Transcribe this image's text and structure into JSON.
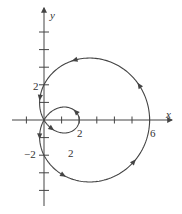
{
  "chart_data": {
    "type": "line",
    "title": "",
    "curve": "polar r = 2 + 4cos(theta), limacon with inner loop",
    "xlabel": "x",
    "ylabel": "y",
    "xlim": [
      -2,
      7
    ],
    "ylim": [
      -5,
      6
    ],
    "x_tick_labels": [
      {
        "value": 2,
        "label": "2"
      },
      {
        "value": 6,
        "label": "6"
      }
    ],
    "y_tick_labels": [
      {
        "value": 2,
        "label": "2"
      },
      {
        "value": -2,
        "label": "-2"
      }
    ],
    "x_ticks": [
      -1,
      1,
      2,
      3,
      4,
      5,
      6
    ],
    "y_ticks": [
      -4,
      -3,
      -2,
      -1,
      1,
      2,
      3,
      4,
      5
    ],
    "annotations": [
      {
        "x": 1.5,
        "y": -2,
        "text": "2"
      }
    ],
    "key_points": [
      {
        "x": 6,
        "y": 0
      },
      {
        "x": 0,
        "y": 2
      },
      {
        "x": 0,
        "y": -2
      },
      {
        "x": 2,
        "y": 0
      },
      {
        "x": 0,
        "y": 0
      }
    ],
    "grid": false,
    "legend": null,
    "line_color": "#444444"
  },
  "labels": {
    "x_axis": "x",
    "y_axis": "y",
    "tick_x_2": "2",
    "tick_x_6": "6",
    "tick_y_2": "2",
    "tick_y_neg2": "−2",
    "region_label": "2"
  }
}
